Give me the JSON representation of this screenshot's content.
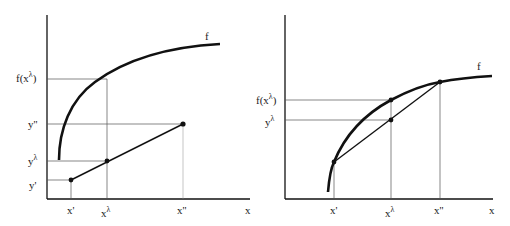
{
  "left_panel": {
    "curve_label": "f",
    "x_axis_label": "x",
    "x_ticks": {
      "x_prime": "x'",
      "x_lambda_base": "x",
      "x_lambda_sup": "λ",
      "x_double": "x''"
    },
    "y_ticks": {
      "f_x_lambda_pre": "f(x",
      "f_x_lambda_sup": "λ",
      "f_x_lambda_post": ")",
      "y_double": "y''",
      "y_lambda_base": "y",
      "y_lambda_sup": "λ",
      "y_prime": "y'"
    },
    "description": "Concave curve f lies above chord of line segment between (x',y') and (x'',y'')"
  },
  "right_panel": {
    "curve_label": "f",
    "x_axis_label": "x",
    "x_ticks": {
      "x_prime": "x'",
      "x_lambda_base": "x",
      "x_lambda_sup": "λ",
      "x_double": "x''"
    },
    "y_ticks": {
      "f_x_lambda_pre": "f(x",
      "f_x_lambda_sup": "λ",
      "f_x_lambda_post": ")",
      "y_lambda_base": "y",
      "y_lambda_sup": "λ"
    },
    "description": "Concave function f: f(x^λ) ≥ y^λ on chord between (x',f(x')) and (x'',f(x''))"
  },
  "colors": {
    "ink": "#111111",
    "guide": "#555555",
    "background": "#ffffff"
  }
}
